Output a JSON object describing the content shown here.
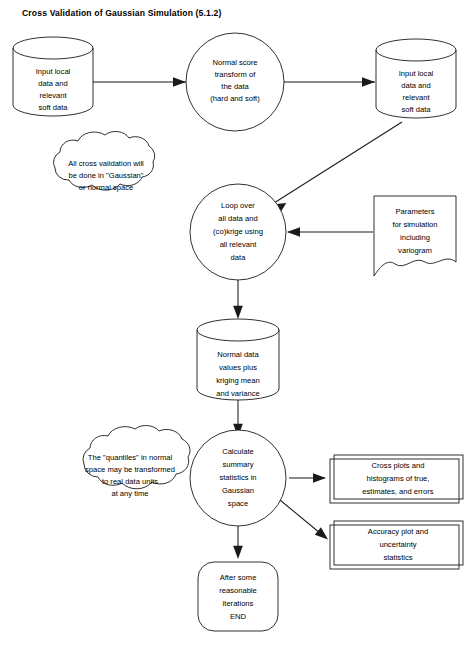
{
  "title": "Cross Validation of Gaussian Simulation (5.1.2)",
  "caption": "",
  "colors": {
    "stroke": "#1a1a1a",
    "fill": "#ffffff",
    "text": "#000000",
    "background": "#ffffff"
  },
  "nodes": {
    "input_data_left": {
      "shape": "cylinder",
      "lines": [
        "Input local",
        "data and",
        "relevant",
        "soft data"
      ]
    },
    "normal_score_transform": {
      "shape": "circle",
      "lines": [
        "Normal score",
        "transform of",
        "the data",
        "(hard and soft)"
      ]
    },
    "input_data_right": {
      "shape": "cylinder",
      "lines": [
        "Input local",
        "data and",
        "relevant",
        "soft data"
      ]
    },
    "cloud_gaussian_space": {
      "shape": "cloud",
      "lines": [
        "All cross validation will",
        "be done in \"Gaussian\"",
        "or normal space"
      ]
    },
    "loop_krige": {
      "shape": "circle",
      "lines": [
        "Loop over",
        "all data and",
        "(co)krige using",
        "all relevant",
        "data"
      ]
    },
    "parameters_document": {
      "shape": "document",
      "lines": [
        "Parameters",
        "for simulation",
        "including",
        "variogram"
      ]
    },
    "normal_data_values": {
      "shape": "cylinder",
      "lines": [
        "Normal data",
        "values plus",
        "kriging mean",
        "and variance"
      ]
    },
    "cloud_quantiles": {
      "shape": "cloud",
      "lines": [
        "The \"quantiles\" in normal",
        "space may be transformed",
        "to real data units",
        "at any time"
      ]
    },
    "calculate_summary_stats": {
      "shape": "circle",
      "lines": [
        "Calculate",
        "summary",
        "statistics in",
        "Gaussian",
        "space"
      ]
    },
    "cross_plots_output": {
      "shape": "double-box",
      "lines": [
        "Cross plots and",
        "histograms of true,",
        "estimates, and errors"
      ]
    },
    "accuracy_plot_output": {
      "shape": "double-box",
      "lines": [
        "Accuracy plot and",
        "uncertainty",
        "statistics"
      ]
    },
    "end_node": {
      "shape": "rounded-rect",
      "lines": [
        "After some",
        "reasonable",
        "iterations",
        "END"
      ]
    }
  },
  "edges": [
    {
      "name": "input-left-to-transform",
      "from": "input_data_left",
      "to": "normal_score_transform"
    },
    {
      "name": "transform-to-input-right",
      "from": "normal_score_transform",
      "to": "input_data_right"
    },
    {
      "name": "input-right-to-loop",
      "from": "input_data_right",
      "to": "loop_krige"
    },
    {
      "name": "parameters-to-loop",
      "from": "parameters_document",
      "to": "loop_krige"
    },
    {
      "name": "loop-to-normal-data",
      "from": "loop_krige",
      "to": "normal_data_values"
    },
    {
      "name": "normal-data-to-calculate",
      "from": "normal_data_values",
      "to": "calculate_summary_stats"
    },
    {
      "name": "calculate-to-cross-plots",
      "from": "calculate_summary_stats",
      "to": "cross_plots_output"
    },
    {
      "name": "calculate-to-accuracy-plot",
      "from": "calculate_summary_stats",
      "to": "accuracy_plot_output"
    },
    {
      "name": "calculate-to-end",
      "from": "calculate_summary_stats",
      "to": "end_node"
    }
  ]
}
